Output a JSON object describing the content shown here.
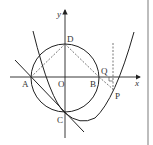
{
  "figure": {
    "axes": {
      "x_label": "x",
      "y_label": "y",
      "origin_label": "O"
    },
    "points": [
      {
        "name": "A",
        "label": "A"
      },
      {
        "name": "B",
        "label": "B"
      },
      {
        "name": "C",
        "label": "C"
      },
      {
        "name": "D",
        "label": "D"
      },
      {
        "name": "P",
        "label": "P"
      },
      {
        "name": "Q",
        "label": "Q"
      }
    ],
    "elements": [
      "circle through A, B, C, D",
      "parabola through C with vertex right of y-axis",
      "line through A and C",
      "dashed segments DA, DB, BP",
      "dashed vertical line through P",
      "right-angle mark at foot of vertical on x-axis"
    ],
    "colors": {
      "stroke": "#222222",
      "dashed": "#555555",
      "edge": "#bdbdbd"
    }
  }
}
